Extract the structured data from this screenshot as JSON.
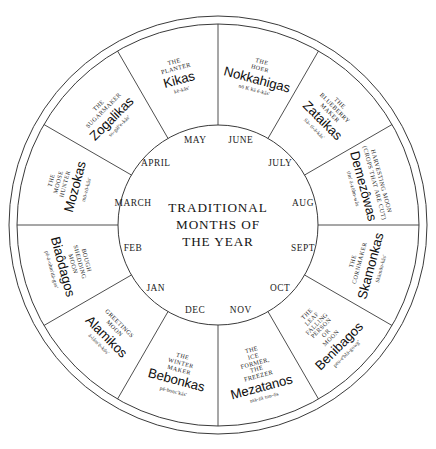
{
  "center": {
    "line1": "TRADITIONAL",
    "line2": "MONTHS OF",
    "line3": "THE YEAR"
  },
  "months": [
    {
      "label": "JUNE"
    },
    {
      "label": "JULY"
    },
    {
      "label": "AUG"
    },
    {
      "label": "SEPT"
    },
    {
      "label": "OCT"
    },
    {
      "label": "NOV"
    },
    {
      "label": "DEC"
    },
    {
      "label": "JAN"
    },
    {
      "label": "FEB"
    },
    {
      "label": "MARCH"
    },
    {
      "label": "APRIL"
    },
    {
      "label": "MAY"
    }
  ],
  "segments": [
    {
      "english": "THE\nHOER",
      "name": "Nokkahigas",
      "phonetic": "nō K kā é-kås'"
    },
    {
      "english": "THE\nBLUEBERRY\nMAKER",
      "name": "Zataikas",
      "phonetic": "Sä- tī-ä-kås'"
    },
    {
      "english": "HARVESTING MOON\n(CROPS THAT ARE CUT)",
      "name": "Demezôwas",
      "phonetic": "tlm' ä-zōhn-wås"
    },
    {
      "english": "THE\nCORNMAKER",
      "name": "Skamonkas",
      "phonetic": "Skämōn-kås'"
    },
    {
      "english": "THE\nLEAF\nFALLING\nPERSON\nOR\nMOON",
      "name": "Benibagos",
      "phonetic": "peu-e'blä-gowg'"
    },
    {
      "english": "THE\nICE\nFORMER,\nTHE\nFREEZER",
      "name": "Mezatanos",
      "phonetic": "mä-zä tun-ōs"
    },
    {
      "english": "THE\nWINTER\nMAKER",
      "name": "Bebonkas",
      "phonetic": "pē-bonc'kás'"
    },
    {
      "english": "GREETINGS\nMOON",
      "name": "Alamikos",
      "phonetic": "ä-låm'ē-kōs'"
    },
    {
      "english": "BOUGH\nSHEDDING\nMOON",
      "name": "Biaôdagos",
      "phonetic": "pē-ä-ohm'dä-gos'"
    },
    {
      "english": "THE\nMOOSE\nHUNTER",
      "name": "Mozokas",
      "phonetic": "mō-zō-kås'"
    },
    {
      "english": "THE\nSUGARMAKER",
      "name": "Zogalikas",
      "phonetic": "so-gäl'e-kås'"
    },
    {
      "english": "THE\nPLANTER",
      "name": "Kikas",
      "phonetic": "kē-kås'"
    }
  ],
  "style": {
    "stroke": "#3a3a3a",
    "background": "#ffffff"
  }
}
